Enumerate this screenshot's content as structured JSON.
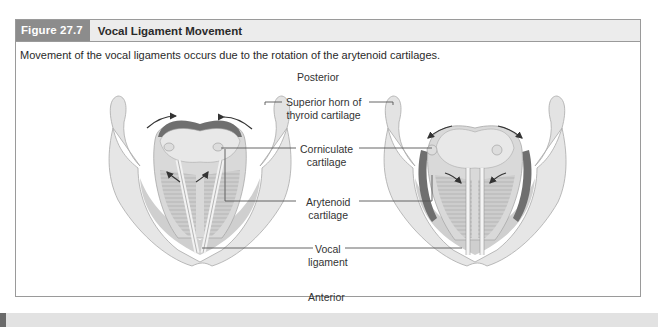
{
  "figure": {
    "label": "Figure 27.7",
    "title": "Vocal Ligament Movement",
    "caption": "Movement of the vocal ligaments occurs due to the rotation of the arytenoid cartilages."
  },
  "orientation": {
    "top": "Posterior",
    "bottom": "Anterior"
  },
  "labels": {
    "superior_horn": [
      "Superior horn of",
      "thyroid cartilage"
    ],
    "corniculate": [
      "Corniculate",
      "cartilage"
    ],
    "arytenoid": [
      "Arytenoid",
      "cartilage"
    ],
    "vocal_ligament": [
      "Vocal",
      "ligament"
    ]
  },
  "panels": [
    {
      "name": "adduction",
      "arrows": "rotate inward (ligaments close)"
    },
    {
      "name": "abduction",
      "arrows": "rotate outward (ligaments open)"
    }
  ],
  "colors": {
    "frame_border": "#9a9a9a",
    "header_bg": "#ececec",
    "label_bg": "#8c8c8c",
    "tissue_light": "#e4e4e4",
    "tissue_mid": "#cfcfcf",
    "muscle_dark": "#6e6e6e",
    "leader_line": "#555555"
  }
}
